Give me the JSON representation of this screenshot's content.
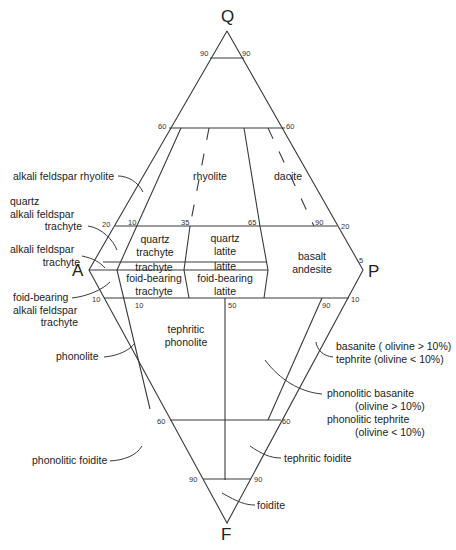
{
  "diagram": {
    "vertices": {
      "Q": "Q",
      "A": "A",
      "P": "P",
      "F": "F"
    },
    "ticks": {
      "q90_left": "90",
      "q90_right": "90",
      "q60_left": "60",
      "q60_right": "60",
      "q20_left": "20",
      "q20_right": "20",
      "q10": "10",
      "q35": "35",
      "q65": "65",
      "q90": "90",
      "p5": "5",
      "f10_left": "10",
      "f10_right": "10",
      "f10_inner": "10",
      "f50": "50",
      "f90_inner": "90",
      "f60_left": "60",
      "f60_right": "60",
      "f90_left": "90",
      "f90_right": "90"
    },
    "fields_inside": {
      "rhyolite": "rhyolite",
      "dacite": "dacite",
      "quartz_trachyte": [
        "quartz",
        "trachyte"
      ],
      "quartz_latite": [
        "quartz",
        "latite"
      ],
      "trachyte": "trachyte",
      "latite": "latite",
      "foid_bearing_trachyte": [
        "foid-bearing",
        "trachyte"
      ],
      "foid_bearing_latite": [
        "foid-bearing",
        "latite"
      ],
      "basalt_andesite": [
        "basalt",
        "andesite"
      ],
      "tephritic_phonolite": [
        "tephritic",
        "phonolite"
      ]
    },
    "callouts_left": {
      "alkali_feldspar_rhyolite": "alkali feldspar rhyolite",
      "quartz_alkali_feldspar_trachyte": [
        "quartz",
        "alkali feldspar",
        "trachyte"
      ],
      "alkali_feldspar_trachyte": [
        "alkali feldspar",
        "trachyte"
      ],
      "foid_bearing_alkali_feldspar_trachyte": [
        "foid-bearing",
        "alkali feldspar",
        "trachyte"
      ],
      "phonolite": "phonolite",
      "phonolitic_foidite": "phonolitic foidite"
    },
    "callouts_right": {
      "basanite": "basanite ( olivine > 10%)",
      "tephrite": "tephrite  (olivine < 10%)",
      "phonolitic_basanite": [
        "phonolitic basanite",
        "(olivine > 10%)"
      ],
      "phonolitic_tephrite": [
        "phonolitic tephrite",
        "(olivine < 10%)"
      ],
      "tephritic_foidite": "tephritic foidite",
      "foidite": "foidite"
    }
  }
}
